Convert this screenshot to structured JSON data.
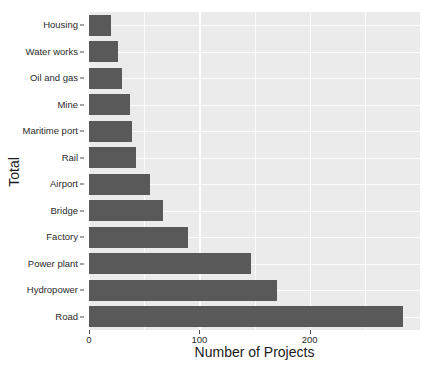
{
  "chart_data": {
    "type": "bar",
    "orientation": "horizontal",
    "title": "",
    "xlabel": "Number of Projects",
    "ylabel": "Total",
    "categories": [
      "Housing",
      "Water works",
      "Oil and gas",
      "Mine",
      "Maritime port",
      "Rail",
      "Airport",
      "Bridge",
      "Factory",
      "Power plant",
      "Hydropower",
      "Road"
    ],
    "values": [
      20,
      26,
      30,
      37,
      39,
      43,
      55,
      67,
      90,
      147,
      170,
      285
    ],
    "xlim": [
      0,
      300
    ],
    "ylim": null,
    "xticks": [
      0,
      100,
      200
    ],
    "xtick_labels": [
      "0",
      "100",
      "200"
    ],
    "xminorticks": [
      50,
      150,
      250
    ],
    "grid": true,
    "legend": null,
    "bar_color": "#595959",
    "panel_color": "#ebebeb",
    "grid_color": "#ffffff"
  },
  "axes": {
    "y_title": "Total",
    "x_title": "Number of Projects"
  }
}
